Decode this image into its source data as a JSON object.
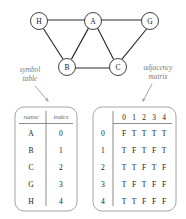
{
  "figure": {
    "annotations": {
      "left_label_line1": "symbol",
      "left_label_line2": "table",
      "right_label_line1": "adjacency",
      "right_label_line2": "matrix"
    },
    "colors": {
      "ink": "#1a1a1a",
      "annotation": "#7a7a7a",
      "box_border": "#9a9a9a",
      "edge": "#2b2b2b",
      "background": "#ffffff"
    }
  },
  "graph": {
    "nodes": [
      {
        "id": "H",
        "label": "H",
        "cx": 39,
        "cy": 21,
        "r": 8.5
      },
      {
        "id": "A",
        "label": "A",
        "cx": 93,
        "cy": 21,
        "r": 8.5
      },
      {
        "id": "G",
        "label": "G",
        "cx": 150,
        "cy": 21,
        "r": 8.5
      },
      {
        "id": "B",
        "label": "B",
        "cx": 67,
        "cy": 67,
        "r": 8.5
      },
      {
        "id": "C",
        "label": "C",
        "cx": 118,
        "cy": 67,
        "r": 8.5
      }
    ],
    "edges": [
      {
        "from": "H",
        "to": "A"
      },
      {
        "from": "A",
        "to": "G"
      },
      {
        "from": "H",
        "to": "B"
      },
      {
        "from": "A",
        "to": "B"
      },
      {
        "from": "A",
        "to": "C"
      },
      {
        "from": "G",
        "to": "C"
      },
      {
        "from": "B",
        "to": "C"
      }
    ]
  },
  "symbol_table": {
    "headers": [
      "name",
      "index"
    ],
    "rows": [
      {
        "name": "A",
        "index": "0"
      },
      {
        "name": "B",
        "index": "1"
      },
      {
        "name": "C",
        "index": "2"
      },
      {
        "name": "G",
        "index": "3"
      },
      {
        "name": "H",
        "index": "4"
      }
    ]
  },
  "adjacency_matrix": {
    "column_headers": [
      "0",
      "1",
      "2",
      "3",
      "4"
    ],
    "row_headers": [
      "0",
      "1",
      "2",
      "3",
      "4"
    ],
    "rows": [
      [
        "F",
        "T",
        "T",
        "T",
        "T"
      ],
      [
        "T",
        "F",
        "T",
        "F",
        "T"
      ],
      [
        "T",
        "T",
        "F",
        "T",
        "F"
      ],
      [
        "T",
        "F",
        "T",
        "F",
        "F"
      ],
      [
        "T",
        "T",
        "F",
        "F",
        "F"
      ]
    ]
  }
}
